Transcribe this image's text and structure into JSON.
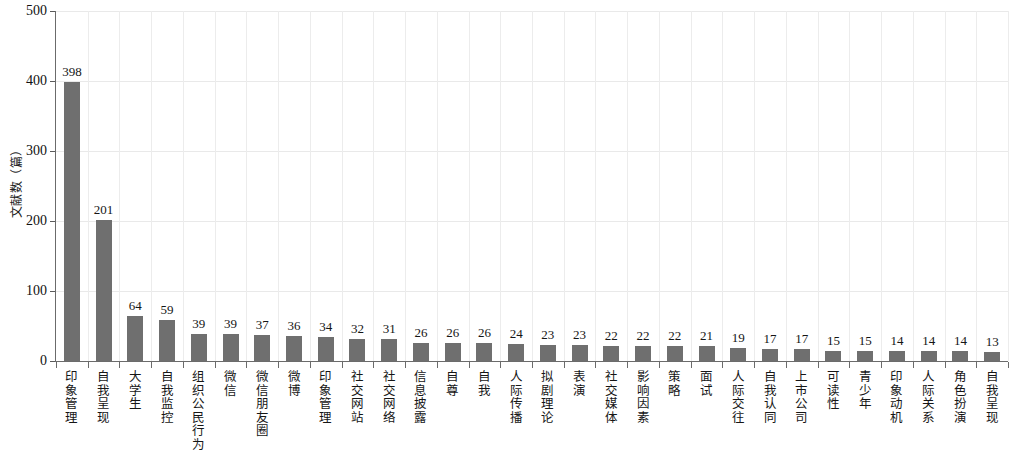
{
  "chart_data": {
    "type": "bar",
    "title": "",
    "subtitle": "",
    "xlabel": "",
    "ylabel": "文献数（篇）",
    "ylim": [
      0,
      500
    ],
    "y_ticks": [
      0,
      100,
      200,
      300,
      400,
      500
    ],
    "grid": true,
    "legend": null,
    "orientation": "vertical",
    "bar_color": "#6f6f6f",
    "categories": [
      "印象管理",
      "自我呈现",
      "大学生",
      "自我监控",
      "组织公民行为",
      "微信",
      "微信朋友圈",
      "微博",
      "印象管理",
      "社交网站",
      "社交网络",
      "信息披露",
      "自尊",
      "自我",
      "人际传播",
      "拟剧理论",
      "表演",
      "社交媒体",
      "影响因素",
      "策略",
      "面试",
      "人际交往",
      "自我认同",
      "上市公司",
      "可读性",
      "青少年",
      "印象动机",
      "人际关系",
      "角色扮演",
      "自我呈现"
    ],
    "values": [
      398,
      201,
      64,
      59,
      39,
      39,
      37,
      36,
      34,
      32,
      31,
      26,
      26,
      26,
      24,
      23,
      23,
      22,
      22,
      22,
      21,
      19,
      17,
      17,
      15,
      15,
      14,
      14,
      14,
      13
    ],
    "value_labels": [
      "398",
      "201",
      "64",
      "59",
      "39",
      "39",
      "37",
      "36",
      "34",
      "32",
      "31",
      "26",
      "26",
      "26",
      "24",
      "23",
      "23",
      "22",
      "22",
      "22",
      "21",
      "19",
      "17",
      "17",
      "15",
      "15",
      "14",
      "14",
      "14",
      "13"
    ]
  }
}
